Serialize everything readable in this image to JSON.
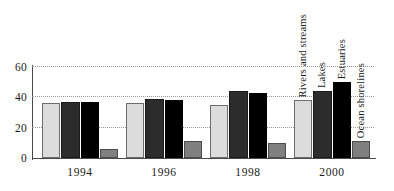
{
  "chart_data": {
    "type": "bar",
    "title": "",
    "subtitle": "",
    "xlabel": "",
    "ylabel": "",
    "categories": [
      "1994",
      "1996",
      "1998",
      "2000"
    ],
    "ylim": [
      0,
      60
    ],
    "yticks": [
      0,
      20,
      40,
      60
    ],
    "ytick_labels": [
      "0",
      "20",
      "40",
      "60"
    ],
    "grid": true,
    "legend_position": "above-last-group-vertical",
    "series": [
      {
        "name": "Rivers and streams",
        "color": "#dcdcdc",
        "values": [
          36,
          36,
          35,
          38
        ]
      },
      {
        "name": "Lakes",
        "color": "#2c2c2c",
        "values": [
          37,
          39,
          44,
          44
        ]
      },
      {
        "name": "Estuaries",
        "color": "#000000",
        "values": [
          37,
          38,
          43,
          50
        ]
      },
      {
        "name": "Ocean shorelines",
        "color": "#7f7f7f",
        "values": [
          6,
          11,
          10,
          11
        ]
      }
    ]
  },
  "fragments": {
    "top_clipped": "",
    "bottom_clipped": ""
  }
}
